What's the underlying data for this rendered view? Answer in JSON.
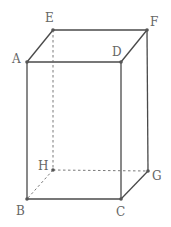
{
  "diagram": {
    "type": "rectangular-prism",
    "vertices": [
      {
        "id": "A",
        "label": "A"
      },
      {
        "id": "B",
        "label": "B"
      },
      {
        "id": "C",
        "label": "C"
      },
      {
        "id": "D",
        "label": "D"
      },
      {
        "id": "E",
        "label": "E"
      },
      {
        "id": "F",
        "label": "F"
      },
      {
        "id": "G",
        "label": "G"
      },
      {
        "id": "H",
        "label": "H"
      }
    ],
    "edges": [
      {
        "from": "A",
        "to": "E",
        "style": "solid"
      },
      {
        "from": "E",
        "to": "F",
        "style": "solid"
      },
      {
        "from": "A",
        "to": "D",
        "style": "solid"
      },
      {
        "from": "D",
        "to": "F",
        "style": "solid"
      },
      {
        "from": "A",
        "to": "B",
        "style": "solid"
      },
      {
        "from": "D",
        "to": "C",
        "style": "solid"
      },
      {
        "from": "F",
        "to": "G",
        "style": "solid"
      },
      {
        "from": "B",
        "to": "C",
        "style": "solid"
      },
      {
        "from": "C",
        "to": "G",
        "style": "solid"
      },
      {
        "from": "E",
        "to": "H",
        "style": "dashed"
      },
      {
        "from": "H",
        "to": "G",
        "style": "dashed"
      },
      {
        "from": "H",
        "to": "B",
        "style": "dashed"
      }
    ]
  }
}
